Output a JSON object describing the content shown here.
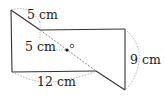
{
  "diagram": {
    "type": "geometry-figure",
    "labels": {
      "top_arc": "5 cm",
      "inner_segment": "5 cm",
      "bottom_arc": "12 cm",
      "right_arc": "9 cm",
      "center_point": "O"
    },
    "points": {
      "A": [
        11,
        10
      ],
      "B": [
        40,
        30
      ],
      "C": [
        125,
        29
      ],
      "D": [
        125,
        90
      ],
      "E": [
        12,
        72
      ],
      "F": [
        96,
        71
      ],
      "O": [
        67,
        50
      ]
    },
    "colors": {
      "line": "#333333",
      "dashed": "#666666"
    }
  }
}
